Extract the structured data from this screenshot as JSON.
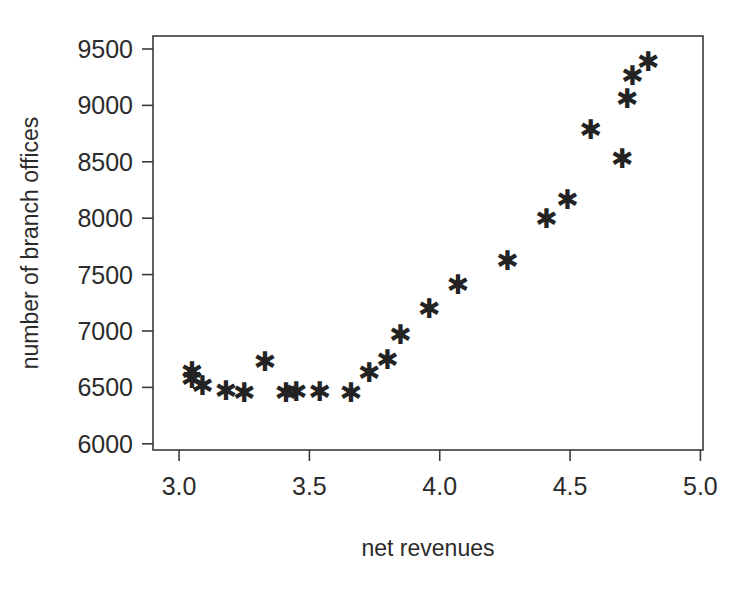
{
  "chart_data": {
    "type": "scatter",
    "title": "",
    "xlabel": "net revenues",
    "ylabel": "number of branch offices",
    "xlim": [
      2.9,
      5.01
    ],
    "ylim": [
      5945,
      9615
    ],
    "grid": false,
    "legend": null,
    "marker": "star",
    "marker_color": "#232323",
    "xticks": [
      "3.0",
      "3.5",
      "4.0",
      "4.5",
      "5.0"
    ],
    "xtick_values": [
      3.0,
      3.5,
      4.0,
      4.5,
      5.0
    ],
    "yticks": [
      "6000",
      "6500",
      "7000",
      "7500",
      "8000",
      "8500",
      "9000",
      "9500"
    ],
    "ytick_values": [
      6000,
      6500,
      7000,
      7500,
      8000,
      8500,
      9000,
      9500
    ],
    "n_points": 27,
    "x": [
      3.05,
      3.05,
      3.09,
      3.18,
      3.25,
      3.33,
      3.41,
      3.45,
      3.54,
      3.58,
      3.66,
      3.74,
      3.8,
      3.96,
      4.07,
      4.26,
      4.41,
      4.49,
      4.58,
      4.66,
      4.7,
      4.72,
      4.8,
      3.5,
      4.13,
      4.35,
      4.62
    ],
    "y": [
      6625,
      6560,
      6500,
      6455,
      6440,
      6710,
      6440,
      6450,
      6450,
      6440,
      6610,
      6730,
      6950,
      7180,
      7395,
      7610,
      7980,
      8150,
      8770,
      8510,
      9040,
      9250,
      9370,
      6450,
      7400,
      7700,
      8600
    ],
    "points": [
      {
        "x": 3.05,
        "y": 6625
      },
      {
        "x": 3.05,
        "y": 6565
      },
      {
        "x": 3.09,
        "y": 6500
      },
      {
        "x": 3.18,
        "y": 6455
      },
      {
        "x": 3.25,
        "y": 6440
      },
      {
        "x": 3.33,
        "y": 6710
      },
      {
        "x": 3.41,
        "y": 6440
      },
      {
        "x": 3.45,
        "y": 6450
      },
      {
        "x": 3.54,
        "y": 6450
      },
      {
        "x": 3.66,
        "y": 6440
      },
      {
        "x": 3.73,
        "y": 6610
      },
      {
        "x": 3.8,
        "y": 6730
      },
      {
        "x": 3.85,
        "y": 6950
      },
      {
        "x": 3.96,
        "y": 7180
      },
      {
        "x": 4.07,
        "y": 7395
      },
      {
        "x": 4.26,
        "y": 7610
      },
      {
        "x": 4.41,
        "y": 7980
      },
      {
        "x": 4.49,
        "y": 8150
      },
      {
        "x": 4.58,
        "y": 8770
      },
      {
        "x": 4.7,
        "y": 8510
      },
      {
        "x": 4.72,
        "y": 9040
      },
      {
        "x": 4.74,
        "y": 9250
      },
      {
        "x": 4.8,
        "y": 9370
      }
    ]
  }
}
